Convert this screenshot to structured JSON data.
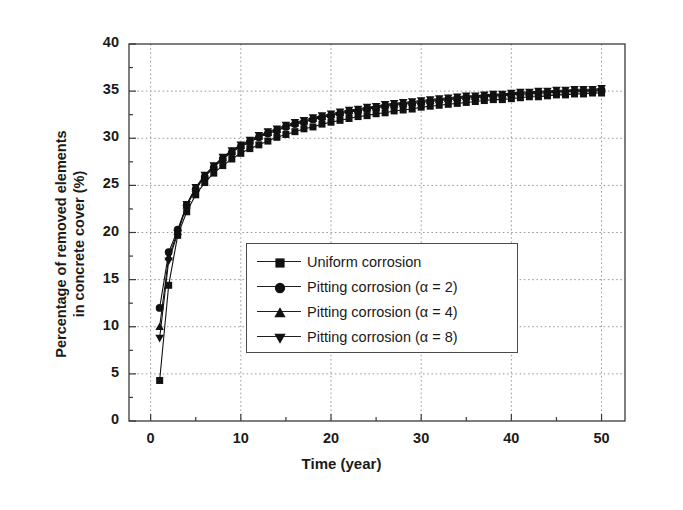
{
  "chart_data": {
    "type": "line",
    "title": "",
    "xlabel": "Time (year)",
    "ylabel": "Percentage of removed elements in concrete cover (%)",
    "ylabel_lines": [
      "Percentage of removed elements",
      "in concrete cover (%)"
    ],
    "xlim": [
      -2.4,
      52.6
    ],
    "ylim": [
      0,
      40
    ],
    "xticks": [
      0,
      10,
      20,
      30,
      40,
      50
    ],
    "xtick_labels": [
      "0",
      "10",
      "20",
      "30",
      "40",
      "50"
    ],
    "xminor_step": 5,
    "yticks": [
      0,
      5,
      10,
      15,
      20,
      25,
      30,
      35,
      40
    ],
    "ytick_labels": [
      "0",
      "5",
      "10",
      "15",
      "20",
      "25",
      "30",
      "35",
      "40"
    ],
    "yminor_step": 2.5,
    "grid": "dotted major gridlines on both axes",
    "legend_position": "center",
    "series": [
      {
        "name": "Uniform corrosion",
        "marker": "square",
        "color": "#111111",
        "x": [
          1,
          2,
          3,
          4,
          5,
          6,
          7,
          8,
          9,
          10,
          11,
          12,
          13,
          14,
          15,
          16,
          17,
          18,
          19,
          20,
          21,
          22,
          23,
          24,
          25,
          26,
          27,
          28,
          29,
          30,
          31,
          32,
          33,
          34,
          35,
          36,
          37,
          38,
          39,
          40,
          41,
          42,
          43,
          44,
          45,
          46,
          47,
          48,
          49,
          50
        ],
        "values": [
          4.3,
          14.4,
          19.7,
          22.2,
          24.0,
          25.3,
          26.3,
          27.1,
          27.8,
          28.4,
          28.9,
          29.3,
          29.7,
          30.1,
          30.4,
          30.7,
          31.0,
          31.2,
          31.5,
          31.7,
          31.9,
          32.1,
          32.3,
          32.4,
          32.6,
          32.7,
          32.9,
          33.0,
          33.1,
          33.3,
          33.4,
          33.5,
          33.6,
          33.7,
          33.8,
          33.9,
          34.0,
          34.1,
          34.1,
          34.2,
          34.3,
          34.4,
          34.4,
          34.5,
          34.6,
          34.6,
          34.7,
          34.7,
          34.8,
          34.8
        ]
      },
      {
        "name": "Pitting corrosion (α = 2)",
        "marker": "circle",
        "color": "#111111",
        "x": [
          1,
          2,
          3,
          4,
          5,
          6,
          7,
          8,
          9,
          10,
          11,
          12,
          13,
          14,
          15,
          16,
          17,
          18,
          19,
          20,
          21,
          22,
          23,
          24,
          25,
          26,
          27,
          28,
          29,
          30,
          31,
          32,
          33,
          34,
          35,
          36,
          37,
          38,
          39,
          40,
          41,
          42,
          43,
          44,
          45,
          46,
          47,
          48,
          49,
          50
        ],
        "values": [
          12.0,
          17.9,
          20.3,
          22.9,
          24.6,
          25.9,
          26.9,
          27.8,
          28.5,
          29.1,
          29.6,
          30.1,
          30.5,
          30.8,
          31.2,
          31.5,
          31.7,
          32.0,
          32.2,
          32.4,
          32.6,
          32.8,
          32.9,
          33.1,
          33.2,
          33.4,
          33.5,
          33.6,
          33.7,
          33.8,
          33.9,
          34.0,
          34.1,
          34.2,
          34.3,
          34.3,
          34.4,
          34.5,
          34.5,
          34.6,
          34.7,
          34.7,
          34.8,
          34.8,
          34.9,
          34.9,
          35.0,
          35.0,
          35.0,
          35.1
        ]
      },
      {
        "name": "Pitting corrosion (α = 4)",
        "marker": "triangle-up",
        "color": "#111111",
        "x": [
          1,
          2,
          3,
          4,
          5,
          6,
          7,
          8,
          9,
          10,
          11,
          12,
          13,
          14,
          15,
          16,
          17,
          18,
          19,
          20,
          21,
          22,
          23,
          24,
          25,
          26,
          27,
          28,
          29,
          30,
          31,
          32,
          33,
          34,
          35,
          36,
          37,
          38,
          39,
          40,
          41,
          42,
          43,
          44,
          45,
          46,
          47,
          48,
          49,
          50
        ],
        "values": [
          10.0,
          17.4,
          20.1,
          22.9,
          24.7,
          26.0,
          27.0,
          27.9,
          28.6,
          29.2,
          29.7,
          30.2,
          30.6,
          30.9,
          31.3,
          31.6,
          31.8,
          32.1,
          32.3,
          32.5,
          32.7,
          32.9,
          33.0,
          33.2,
          33.3,
          33.5,
          33.6,
          33.7,
          33.8,
          33.9,
          34.0,
          34.1,
          34.2,
          34.3,
          34.4,
          34.4,
          34.5,
          34.6,
          34.6,
          34.7,
          34.8,
          34.8,
          34.9,
          34.9,
          35.0,
          35.0,
          35.1,
          35.1,
          35.1,
          35.2
        ]
      },
      {
        "name": "Pitting corrosion (α = 8)",
        "marker": "triangle-down",
        "color": "#111111",
        "x": [
          1,
          2,
          3,
          4,
          5,
          6,
          7,
          8,
          9,
          10,
          11,
          12,
          13,
          14,
          15,
          16,
          17,
          18,
          19,
          20,
          21,
          22,
          23,
          24,
          25,
          26,
          27,
          28,
          29,
          30,
          31,
          32,
          33,
          34,
          35,
          36,
          37,
          38,
          39,
          40,
          41,
          42,
          43,
          44,
          45,
          46,
          47,
          48,
          49,
          50
        ],
        "values": [
          8.8,
          17.0,
          19.9,
          23.0,
          24.8,
          26.1,
          27.1,
          28.0,
          28.7,
          29.3,
          29.8,
          30.3,
          30.7,
          31.0,
          31.4,
          31.7,
          31.9,
          32.2,
          32.4,
          32.6,
          32.8,
          33.0,
          33.1,
          33.3,
          33.4,
          33.6,
          33.7,
          33.8,
          33.9,
          34.0,
          34.1,
          34.2,
          34.3,
          34.4,
          34.5,
          34.5,
          34.6,
          34.7,
          34.7,
          34.8,
          34.9,
          34.9,
          35.0,
          35.0,
          35.1,
          35.1,
          35.2,
          35.2,
          35.2,
          35.3
        ]
      }
    ]
  },
  "legend": {
    "items": [
      {
        "label": "Uniform corrosion",
        "marker": "square"
      },
      {
        "label": "Pitting corrosion (α = 2)",
        "marker": "circle"
      },
      {
        "label": "Pitting corrosion (α = 4)",
        "marker": "triangle-up"
      },
      {
        "label": "Pitting corrosion (α = 8)",
        "marker": "triangle-down"
      }
    ]
  },
  "axes": {
    "x_title": "Time (year)",
    "y_title_line1": "Percentage of removed elements",
    "y_title_line2": "in concrete cover (%)"
  },
  "colors": {
    "ink": "#111111",
    "frame": "#3a3a3a",
    "grid": "#9a9a9a",
    "background": "#ffffff"
  }
}
